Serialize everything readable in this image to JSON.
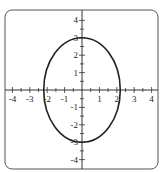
{
  "diagram": {
    "type": "ellipse-graph",
    "equation_shape": "vertical ellipse centered at origin",
    "center": [
      0,
      0
    ],
    "semi_axis_x": 2.2,
    "semi_axis_y": 3,
    "x_range": [
      -4.5,
      4.5
    ],
    "y_range": [
      -4.5,
      4.5
    ],
    "x_tick_labels": [
      "-4",
      "-3",
      "-2",
      "-1",
      "1",
      "2",
      "3",
      "4"
    ],
    "y_tick_labels": [
      "4",
      "3",
      "2",
      "1",
      "-1",
      "-2",
      "-3",
      "-4"
    ],
    "stroke_color": "#222222",
    "frame_color": "#555555"
  }
}
